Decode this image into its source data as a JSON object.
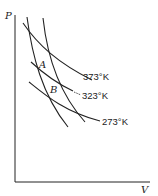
{
  "diagram": {
    "title": "",
    "axes": {
      "y_label": "P",
      "x_label": "V"
    },
    "isotherms": [
      {
        "label": "373°K"
      },
      {
        "label": "323°K"
      },
      {
        "label": "273°K"
      }
    ],
    "points": [
      {
        "label": "A"
      },
      {
        "label": "B"
      }
    ],
    "colors": {
      "line": "#222222",
      "background": "#ffffff"
    }
  }
}
